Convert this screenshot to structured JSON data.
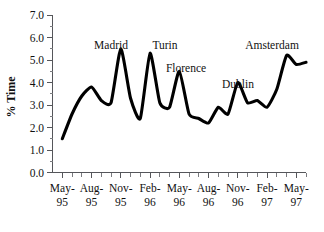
{
  "chart_data": {
    "type": "line",
    "title": "",
    "xlabel": "",
    "ylabel": "% Time",
    "ylim": [
      0.0,
      7.0
    ],
    "ytick_labels": [
      "0.0",
      "1.0",
      "2.0",
      "3.0",
      "4.0",
      "5.0",
      "6.0",
      "7.0"
    ],
    "ytick_values": [
      0.0,
      1.0,
      2.0,
      3.0,
      4.0,
      5.0,
      6.0,
      7.0
    ],
    "grid": false,
    "legend": "none",
    "xtick_labels": [
      {
        "month": "May-",
        "year": "95"
      },
      {
        "month": "Aug-",
        "year": "95"
      },
      {
        "month": "Nov-",
        "year": "95"
      },
      {
        "month": "Feb-",
        "year": "96"
      },
      {
        "month": "May-",
        "year": "96"
      },
      {
        "month": "Aug-",
        "year": "96"
      },
      {
        "month": "Nov-",
        "year": "96"
      },
      {
        "month": "Feb-",
        "year": "97"
      },
      {
        "month": "May-",
        "year": "97"
      }
    ],
    "x": [
      "May-95",
      "Jun-95",
      "Jul-95",
      "Aug-95",
      "Sep-95",
      "Oct-95",
      "Nov-95",
      "Dec-95",
      "Jan-96",
      "Feb-96",
      "Mar-96",
      "Apr-96",
      "May-96",
      "Jun-96",
      "Jul-96",
      "Aug-96",
      "Sep-96",
      "Oct-96",
      "Nov-96",
      "Dec-96",
      "Jan-97",
      "Feb-97",
      "Mar-97",
      "Apr-97",
      "May-97",
      "Jun-97"
    ],
    "values": [
      1.5,
      2.6,
      3.4,
      3.8,
      3.2,
      3.1,
      5.5,
      3.3,
      2.4,
      5.3,
      3.1,
      2.9,
      4.5,
      2.6,
      2.4,
      2.2,
      2.9,
      2.6,
      4.0,
      3.1,
      3.2,
      2.9,
      3.7,
      5.2,
      4.8,
      4.9
    ],
    "series_color": "#000000",
    "annotations": [
      {
        "label": "Madrid",
        "x": "Nov-95",
        "value": 5.5
      },
      {
        "label": "Turin",
        "x": "Feb-96",
        "value": 5.3
      },
      {
        "label": "Florence",
        "x": "May-96",
        "value": 4.5
      },
      {
        "label": "Dublin",
        "x": "Nov-96",
        "value": 4.0
      },
      {
        "label": "Amsterdam",
        "x": "Apr-97",
        "value": 5.2
      }
    ]
  }
}
